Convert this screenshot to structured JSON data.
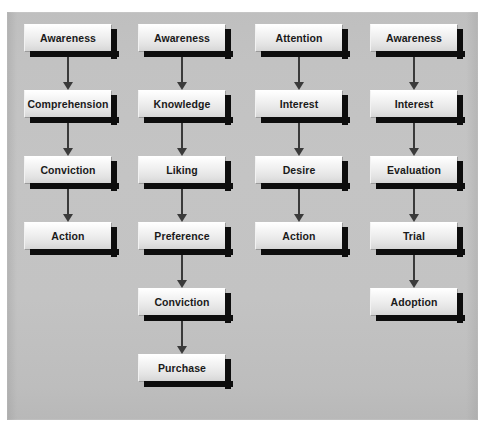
{
  "diagram": {
    "background_color": "#c3c3c3",
    "box_fill_top": "#ffffff",
    "box_fill_bottom": "#d6d6d6",
    "box_border_color": "#9a9a9a",
    "shadow_color": "#0d0d0d",
    "arrow_color": "#3a3a3a",
    "columns": [
      {
        "name": "column-1",
        "steps": [
          {
            "label": "Awareness"
          },
          {
            "label": "Comprehension"
          },
          {
            "label": "Conviction"
          },
          {
            "label": "Action"
          }
        ]
      },
      {
        "name": "column-2",
        "steps": [
          {
            "label": "Awareness"
          },
          {
            "label": "Knowledge"
          },
          {
            "label": "Liking"
          },
          {
            "label": "Preference"
          },
          {
            "label": "Conviction"
          },
          {
            "label": "Purchase"
          }
        ]
      },
      {
        "name": "column-3",
        "steps": [
          {
            "label": "Attention"
          },
          {
            "label": "Interest"
          },
          {
            "label": "Desire"
          },
          {
            "label": "Action"
          }
        ]
      },
      {
        "name": "column-4",
        "steps": [
          {
            "label": "Awareness"
          },
          {
            "label": "Interest"
          },
          {
            "label": "Evaluation"
          },
          {
            "label": "Trial"
          },
          {
            "label": "Adoption"
          }
        ]
      }
    ]
  }
}
